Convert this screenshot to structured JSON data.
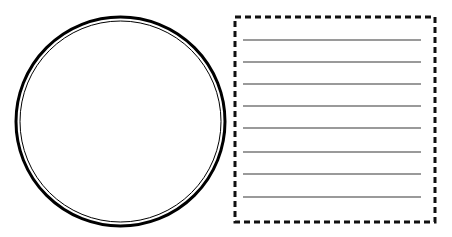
{
  "canvas": {
    "width": 452,
    "height": 237,
    "background": "#ffffff"
  },
  "circle": {
    "cx": 120.5,
    "cy": 121.5,
    "outer_radius": 104.5,
    "outer_stroke_width": 3,
    "inner_radius": 100.5,
    "inner_stroke_width": 1,
    "stroke_color": "#000000"
  },
  "note_box": {
    "x": 235,
    "y": 17,
    "width": 200,
    "height": 205,
    "stroke_color": "#111111",
    "stroke_width": 3,
    "dash": "6 4",
    "lines": {
      "color": "#9a9a9a",
      "width": 2,
      "x_start": 243,
      "x_end": 421,
      "y_positions": [
        40,
        62,
        84,
        106,
        128,
        152,
        174,
        197
      ]
    }
  }
}
